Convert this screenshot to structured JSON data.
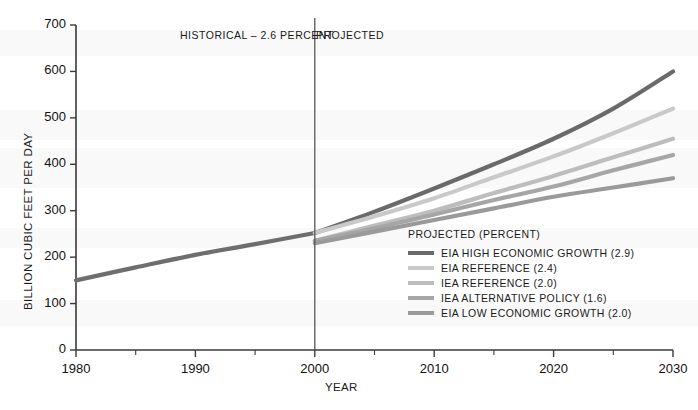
{
  "chart_data": {
    "type": "line",
    "title": "",
    "xlabel": "YEAR",
    "ylabel": "BILLION CUBIC FEET PER DAY",
    "xlim": [
      1980,
      2030
    ],
    "ylim": [
      0,
      700
    ],
    "xticks": [
      1980,
      1990,
      2000,
      2010,
      2020,
      2030
    ],
    "xtick_labels": [
      "1980",
      "1990",
      "2000",
      "2010",
      "2020",
      "2030"
    ],
    "xminor_ticks": [
      1985,
      1995,
      2005,
      2015,
      2025
    ],
    "yticks": [
      0,
      100,
      200,
      300,
      400,
      500,
      600,
      700
    ],
    "ytick_labels": [
      "0",
      "100",
      "200",
      "300",
      "400",
      "500",
      "600",
      "700"
    ],
    "grid": false,
    "legend_position": "center-right",
    "legend_title": "PROJECTED (PERCENT)",
    "annotations": [
      {
        "name": "historical-label",
        "text": "HISTORICAL – 2.6 PERCENT",
        "x": 1991.5,
        "y": 672
      },
      {
        "name": "projected-label",
        "text": "PROJECTED",
        "x": 2002.5,
        "y": 672
      },
      {
        "name": "divider",
        "text": "",
        "x": 2000,
        "y": 700
      }
    ],
    "divider_year": 2000,
    "series": [
      {
        "name": "HISTORICAL",
        "label": "HISTORICAL – 2.6 PERCENT",
        "color": "#6e6e6e",
        "width": 4.2,
        "in_legend": false,
        "x": [
          1980,
          1985,
          1990,
          1995,
          2000
        ],
        "values": [
          150,
          178,
          205,
          228,
          252
        ]
      },
      {
        "name": "EIA_HIGH_ECONOMIC_GROWTH",
        "label": "EIA HIGH ECONOMIC GROWTH (2.9)",
        "percent": 2.9,
        "color": "#6a6a6a",
        "width": 4.2,
        "in_legend": true,
        "x": [
          2000,
          2005,
          2010,
          2015,
          2020,
          2025,
          2030
        ],
        "values": [
          252,
          298,
          348,
          400,
          455,
          520,
          600
        ]
      },
      {
        "name": "EIA_REFERENCE",
        "label": "EIA REFERENCE (2.4)",
        "percent": 2.4,
        "color": "#c9c9c9",
        "width": 4.2,
        "in_legend": true,
        "x": [
          2000,
          2005,
          2010,
          2015,
          2020,
          2025,
          2030
        ],
        "values": [
          252,
          288,
          327,
          372,
          417,
          467,
          520
        ]
      },
      {
        "name": "IEA_REFERENCE",
        "label": "IEA REFERENCE (2.0)",
        "percent": 2.0,
        "color": "#bdbdbd",
        "width": 4.2,
        "in_legend": true,
        "x": [
          2000,
          2005,
          2010,
          2015,
          2020,
          2025,
          2030
        ],
        "values": [
          235,
          268,
          300,
          338,
          375,
          415,
          455
        ]
      },
      {
        "name": "IEA_ALTERNATIVE_POLICY",
        "label": "IEA ALTERNATIVE POLICY (1.6)",
        "percent": 1.6,
        "color": "#a6a6a6",
        "width": 4.2,
        "in_legend": true,
        "x": [
          2000,
          2005,
          2010,
          2015,
          2020,
          2025,
          2030
        ],
        "values": [
          235,
          262,
          292,
          323,
          352,
          387,
          420
        ]
      },
      {
        "name": "EIA_LOW_ECONOMIC_GROWTH",
        "label": "EIA LOW ECONOMIC GROWTH (2.0)",
        "percent": 2.0,
        "color": "#9a9a9a",
        "width": 4.2,
        "in_legend": true,
        "x": [
          2000,
          2005,
          2010,
          2015,
          2020,
          2025,
          2030
        ],
        "values": [
          230,
          255,
          280,
          305,
          330,
          350,
          370
        ]
      }
    ]
  }
}
